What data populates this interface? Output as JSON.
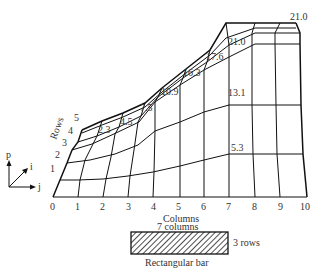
{
  "diagram": {
    "axis_labels": {
      "rows": "Rows",
      "columns": "Columns"
    },
    "row_ticks": [
      "1",
      "2",
      "3",
      "4",
      "5"
    ],
    "column_ticks": [
      "0",
      "1",
      "2",
      "3",
      "4",
      "5",
      "6",
      "7",
      "8",
      "9",
      "10"
    ],
    "values": {
      "v2_3": "2.3",
      "v4_5": "4.5",
      "v7_5": "7.5",
      "v10_9": "10.9",
      "v16_3": "16.3",
      "v17_6": "17.6",
      "v21_0_inner": "21.0",
      "v21_0_top": "21.0",
      "v13_1": "13.1",
      "v5_3": "5.3"
    },
    "coord_axes": {
      "p": "p",
      "i": "i",
      "j": "j"
    },
    "bar": {
      "top_label": "7 columns",
      "side_label": "3 rows",
      "bottom_label": "Rectangular bar"
    }
  }
}
